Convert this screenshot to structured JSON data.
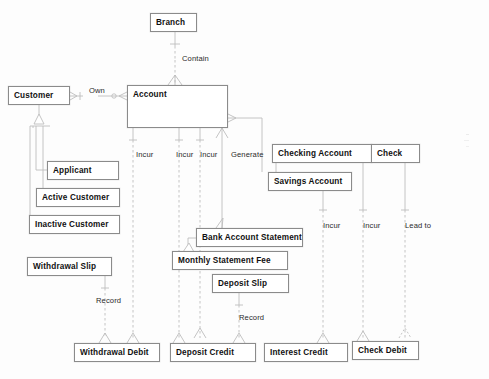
{
  "diagram": {
    "type": "entity-relationship-diagram",
    "colors": {
      "box_border": "#8b8b8b",
      "box_fill": "#ffffff",
      "line": "#b8b8b8",
      "text": "#111111",
      "background": "#fdfdfd"
    },
    "entities": [
      {
        "id": "branch",
        "label": "Branch",
        "x": 150,
        "y": 13,
        "w": 47,
        "h": 19
      },
      {
        "id": "customer",
        "label": "Customer",
        "x": 8,
        "y": 86,
        "w": 62,
        "h": 19
      },
      {
        "id": "account",
        "label": "Account",
        "x": 127,
        "y": 85,
        "w": 101,
        "h": 43
      },
      {
        "id": "applicant",
        "label": "Applicant",
        "x": 47,
        "y": 161,
        "w": 72,
        "h": 19
      },
      {
        "id": "active_customer",
        "label": "Active Customer",
        "x": 36,
        "y": 188,
        "w": 84,
        "h": 19
      },
      {
        "id": "inactive_customer",
        "label": "Inactive Customer",
        "x": 29,
        "y": 215,
        "w": 91,
        "h": 19
      },
      {
        "id": "withdrawal_slip",
        "label": "Withdrawal Slip",
        "x": 27,
        "y": 257,
        "w": 85,
        "h": 19
      },
      {
        "id": "checking_account",
        "label": "Checking Account",
        "x": 272,
        "y": 144,
        "w": 100,
        "h": 19
      },
      {
        "id": "check",
        "label": "Check",
        "x": 371,
        "y": 144,
        "w": 49,
        "h": 19
      },
      {
        "id": "savings_account",
        "label": "Savings Account",
        "x": 268,
        "y": 172,
        "w": 84,
        "h": 19
      },
      {
        "id": "bank_account_stmt",
        "label": "Bank Account Statement",
        "x": 196,
        "y": 228,
        "w": 107,
        "h": 19
      },
      {
        "id": "monthly_stmt_fee",
        "label": "Monthly Statement Fee",
        "x": 172,
        "y": 251,
        "w": 116,
        "h": 19
      },
      {
        "id": "deposit_slip",
        "label": "Deposit Slip",
        "x": 212,
        "y": 274,
        "w": 77,
        "h": 19
      },
      {
        "id": "withdrawal_debit",
        "label": "Withdrawal Debit",
        "x": 74,
        "y": 343,
        "w": 86,
        "h": 19
      },
      {
        "id": "deposit_credit",
        "label": "Deposit Credit",
        "x": 170,
        "y": 343,
        "w": 86,
        "h": 19
      },
      {
        "id": "interest_credit",
        "label": "Interest Credit",
        "x": 264,
        "y": 343,
        "w": 84,
        "h": 19
      },
      {
        "id": "check_debit",
        "label": "Check Debit",
        "x": 352,
        "y": 341,
        "w": 67,
        "h": 19
      }
    ],
    "relationships": [
      {
        "id": "contain",
        "label": "Contain",
        "x": 182,
        "y": 54,
        "from": "branch",
        "to": "account"
      },
      {
        "id": "own",
        "label": "Own",
        "x": 89,
        "y": 86,
        "from": "customer",
        "to": "account"
      },
      {
        "id": "incur_1",
        "label": "Incur",
        "x": 136,
        "y": 150,
        "from": "account",
        "to": "withdrawal_debit"
      },
      {
        "id": "incur_2",
        "label": "Incur",
        "x": 176,
        "y": 150,
        "from": "account",
        "to": "deposit_credit"
      },
      {
        "id": "incur_3",
        "label": "Incur",
        "x": 200,
        "y": 150,
        "from": "account",
        "to": "monthly_stmt_fee"
      },
      {
        "id": "generate",
        "label": "Generate",
        "x": 231,
        "y": 150,
        "from": "account",
        "to": "bank_account_stmt"
      },
      {
        "id": "incur_4",
        "label": "Incur",
        "x": 323,
        "y": 221,
        "from": "savings_account",
        "to": "interest_credit"
      },
      {
        "id": "incur_5",
        "label": "Incur",
        "x": 363,
        "y": 221,
        "from": "checking_account",
        "to": "interest_credit"
      },
      {
        "id": "lead_to",
        "label": "Lead to",
        "x": 405,
        "y": 221,
        "from": "check",
        "to": "check_debit"
      },
      {
        "id": "record_1",
        "label": "Record",
        "x": 96,
        "y": 296,
        "from": "withdrawal_slip",
        "to": "withdrawal_debit"
      },
      {
        "id": "record_2",
        "label": "Record",
        "x": 239,
        "y": 313,
        "from": "deposit_slip",
        "to": "deposit_credit"
      }
    ]
  }
}
